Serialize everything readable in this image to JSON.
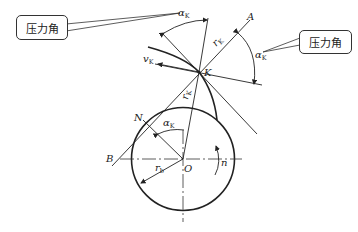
{
  "diagram": {
    "type": "involute gear pressure angle diagram",
    "callouts": [
      {
        "id": "left",
        "text": "压力角"
      },
      {
        "id": "right",
        "text": "压力角"
      }
    ],
    "points": {
      "A": "A",
      "K": "K",
      "N": "N",
      "O": "O",
      "B": "B"
    },
    "labels": {
      "alpha": "α",
      "alpha_sub": "K",
      "v": "v",
      "v_sub": "K",
      "r": "r",
      "r_sub": "K",
      "rb": "r",
      "rb_sub": "b",
      "n": "n"
    },
    "colors": {
      "line": "#222222",
      "background": "#ffffff"
    }
  }
}
